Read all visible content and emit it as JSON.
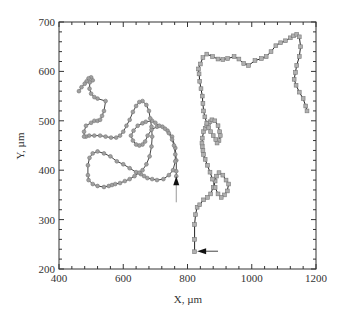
{
  "chart_data": {
    "type": "line",
    "title": "",
    "xlabel": "X, µm",
    "ylabel": "Y, µm",
    "xlim": [
      400,
      1200
    ],
    "ylim": [
      200,
      700
    ],
    "xticks": [
      400,
      600,
      800,
      1000,
      1200
    ],
    "yticks": [
      200,
      300,
      400,
      500,
      600,
      700
    ],
    "xtick_labels": [
      "400",
      "600",
      "800",
      "1000",
      "1200"
    ],
    "ytick_labels": [
      "200",
      "300",
      "400",
      "500",
      "600",
      "700"
    ],
    "grid": false,
    "legend": null,
    "series": [
      {
        "name": "trajectory-circles",
        "marker": "circle",
        "color": "#444444",
        "marker_fill": "#a0a0a0",
        "x": [
          765,
          765,
          765,
          762,
          752,
          738,
          722,
          705,
          688,
          676,
          668,
          660,
          650,
          640,
          630,
          624,
          632,
          645,
          660,
          670,
          690,
          700,
          712,
          730,
          742,
          752,
          758,
          762,
          762,
          755,
          742,
          725,
          705,
          690,
          675,
          665,
          655,
          640,
          620,
          600,
          580,
          560,
          540,
          520,
          505,
          495,
          490,
          490,
          492,
          505,
          520,
          540,
          555,
          565,
          575,
          590,
          605,
          620,
          635,
          650,
          660,
          672,
          682,
          688,
          690,
          688,
          684,
          680,
          672,
          660,
          650,
          640,
          630,
          620,
          610,
          600,
          590,
          578,
          562,
          545,
          528,
          510,
          494,
          484,
          478,
          478,
          484,
          500,
          510,
          520,
          528,
          534,
          540,
          545,
          520,
          510,
          500,
          495,
          496,
          505,
          500,
          492,
          486,
          480,
          470,
          462
        ],
        "y": [
          388,
          398,
          420,
          445,
          468,
          480,
          488,
          488,
          482,
          470,
          458,
          452,
          450,
          452,
          460,
          470,
          480,
          490,
          495,
          498,
          500,
          496,
          490,
          484,
          475,
          462,
          450,
          432,
          418,
          400,
          390,
          382,
          380,
          382,
          384,
          388,
          392,
          396,
          404,
          412,
          418,
          428,
          434,
          438,
          434,
          425,
          410,
          390,
          380,
          372,
          368,
          366,
          368,
          370,
          372,
          374,
          378,
          382,
          388,
          395,
          400,
          412,
          428,
          448,
          468,
          488,
          505,
          520,
          532,
          540,
          538,
          530,
          518,
          502,
          490,
          478,
          470,
          466,
          466,
          468,
          470,
          470,
          470,
          468,
          468,
          478,
          490,
          496,
          500,
          500,
          502,
          510,
          520,
          540,
          545,
          548,
          555,
          565,
          578,
          582,
          588,
          586,
          580,
          575,
          568,
          560
        ]
      },
      {
        "name": "trajectory-squares",
        "marker": "square",
        "color": "#222222",
        "marker_fill": "#b0b0b0",
        "x": [
          822,
          822,
          822,
          825,
          830,
          838,
          850,
          862,
          872,
          880,
          886,
          890,
          898,
          910,
          920,
          928,
          924,
          915,
          905,
          895,
          886,
          878,
          870,
          862,
          855,
          850,
          848,
          846,
          845,
          846,
          850,
          855,
          860,
          866,
          870,
          876,
          885,
          895,
          900,
          902,
          898,
          892,
          888,
          880,
          872,
          866,
          860,
          854,
          850,
          848,
          846,
          842,
          838,
          836,
          834,
          840,
          848,
          860,
          878,
          895,
          910,
          925,
          945,
          960,
          975,
          990,
          1010,
          1030,
          1045,
          1060,
          1075,
          1090,
          1105,
          1120,
          1130,
          1140,
          1148,
          1152,
          1148,
          1140,
          1136,
          1132,
          1138,
          1148,
          1160,
          1168,
          1172
        ],
        "y": [
          235,
          260,
          290,
          310,
          325,
          330,
          340,
          345,
          352,
          365,
          378,
          388,
          395,
          390,
          380,
          372,
          358,
          350,
          345,
          352,
          365,
          382,
          396,
          410,
          422,
          432,
          440,
          448,
          455,
          465,
          478,
          485,
          490,
          495,
          498,
          502,
          500,
          490,
          478,
          470,
          460,
          455,
          462,
          470,
          478,
          486,
          495,
          508,
          520,
          535,
          550,
          565,
          580,
          595,
          605,
          615,
          628,
          635,
          630,
          625,
          624,
          626,
          630,
          625,
          616,
          612,
          622,
          626,
          630,
          640,
          652,
          658,
          662,
          668,
          672,
          675,
          670,
          650,
          630,
          612,
          598,
          584,
          572,
          558,
          545,
          530,
          520
        ]
      }
    ],
    "annotations": [
      {
        "type": "arrow",
        "direction": "up",
        "tip": [
          765,
          388
        ],
        "tail": [
          765,
          335
        ],
        "note": "start of circle trajectory"
      },
      {
        "type": "arrow",
        "direction": "left",
        "tip": [
          830,
          236
        ],
        "tail": [
          895,
          236
        ],
        "note": "start of square trajectory"
      }
    ]
  }
}
